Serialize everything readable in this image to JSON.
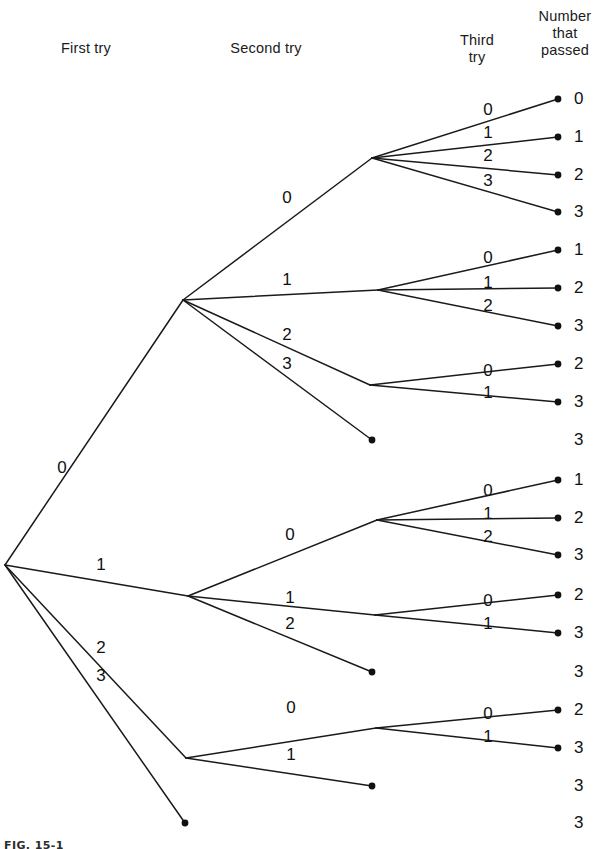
{
  "figure": {
    "caption": "FIG. 15-1",
    "headers": [
      {
        "id": "first-try",
        "label": "First try",
        "x": 86,
        "y": 40
      },
      {
        "id": "second-try",
        "label": "Second try",
        "x": 266,
        "y": 40
      },
      {
        "id": "third-try",
        "label": "Third\ntry",
        "x": 477,
        "y": 32
      },
      {
        "id": "number-passed",
        "label": "Number\nthat\npassed",
        "x": 565,
        "y": 8
      }
    ],
    "line_color": "#1a1a1a",
    "dot_color": "#111111"
  },
  "chart_data": {
    "type": "tree",
    "stages": [
      "First try",
      "Second try",
      "Third try",
      "Number that passed"
    ],
    "root": {
      "x": 5,
      "y": 565
    },
    "nodes": [
      {
        "id": "root",
        "x": 5,
        "y": 565
      },
      {
        "id": "n-0",
        "x": 183,
        "y": 300
      },
      {
        "id": "n-00",
        "x": 372,
        "y": 158
      },
      {
        "id": "n-01",
        "x": 378,
        "y": 290
      },
      {
        "id": "n-02",
        "x": 370,
        "y": 385
      },
      {
        "id": "n-1",
        "x": 188,
        "y": 596
      },
      {
        "id": "n-10",
        "x": 377,
        "y": 520
      },
      {
        "id": "n-11",
        "x": 375,
        "y": 615
      },
      {
        "id": "n-2",
        "x": 186,
        "y": 758
      },
      {
        "id": "n-20",
        "x": 376,
        "y": 728
      }
    ],
    "edges": [
      {
        "from": "root",
        "to": "n-0",
        "label": "0",
        "lx": 62,
        "ly": 468
      },
      {
        "from": "root",
        "to": "n-1",
        "label": "1",
        "lx": 101,
        "ly": 565
      },
      {
        "from": "root",
        "to": "n-2",
        "label": "2",
        "lx": 101,
        "ly": 648
      },
      {
        "from": "root",
        "to": "t-3a",
        "label": "3",
        "lx": 101,
        "ly": 676
      },
      {
        "from": "n-0",
        "to": "n-00",
        "label": "0",
        "lx": 287,
        "y0": 0,
        "ly": 198
      },
      {
        "from": "n-0",
        "to": "n-01",
        "label": "1",
        "lx": 287,
        "ly": 280
      },
      {
        "from": "n-0",
        "to": "n-02",
        "label": "2",
        "lx": 287,
        "ly": 335
      },
      {
        "from": "n-0",
        "to": "t-3b",
        "label": "3",
        "lx": 287,
        "ly": 364
      },
      {
        "from": "n-1",
        "to": "n-10",
        "label": "0",
        "lx": 290,
        "ly": 535
      },
      {
        "from": "n-1",
        "to": "n-11",
        "label": "1",
        "lx": 290,
        "ly": 598
      },
      {
        "from": "n-1",
        "to": "t-3c",
        "label": "2",
        "lx": 290,
        "ly": 624
      },
      {
        "from": "n-2",
        "to": "n-20",
        "label": "0",
        "lx": 291,
        "ly": 708
      },
      {
        "from": "n-2",
        "to": "t-3d",
        "label": "1",
        "lx": 291,
        "ly": 755
      },
      {
        "from": "n-00",
        "to": "e-0",
        "label": "0",
        "lx": 488,
        "ly": 110
      },
      {
        "from": "n-00",
        "to": "e-1",
        "label": "1",
        "lx": 488,
        "ly": 133
      },
      {
        "from": "n-00",
        "to": "e-2",
        "label": "2",
        "lx": 488,
        "ly": 156
      },
      {
        "from": "n-00",
        "to": "e-3",
        "label": "3",
        "lx": 488,
        "ly": 181
      },
      {
        "from": "n-01",
        "to": "e-4",
        "label": "0",
        "lx": 488,
        "ly": 258
      },
      {
        "from": "n-01",
        "to": "e-5",
        "label": "1",
        "lx": 488,
        "ly": 283
      },
      {
        "from": "n-01",
        "to": "e-6",
        "label": "2",
        "lx": 488,
        "ly": 306
      },
      {
        "from": "n-02",
        "to": "e-7",
        "label": "0",
        "lx": 488,
        "ly": 371
      },
      {
        "from": "n-02",
        "to": "e-8",
        "label": "1",
        "lx": 488,
        "ly": 393
      },
      {
        "from": "n-10",
        "to": "e-9",
        "label": "0",
        "lx": 488,
        "ly": 491
      },
      {
        "from": "n-10",
        "to": "e-10",
        "label": "1",
        "lx": 488,
        "ly": 514
      },
      {
        "from": "n-10",
        "to": "e-11",
        "label": "2",
        "lx": 488,
        "ly": 537
      },
      {
        "from": "n-11",
        "to": "e-12",
        "label": "0",
        "lx": 488,
        "ly": 601
      },
      {
        "from": "n-11",
        "to": "e-13",
        "label": "1",
        "lx": 488,
        "ly": 624
      },
      {
        "from": "n-20",
        "to": "e-15",
        "label": "0",
        "lx": 488,
        "ly": 714
      },
      {
        "from": "n-20",
        "to": "e-16",
        "label": "1",
        "lx": 488,
        "ly": 737
      }
    ],
    "endpoints": [
      {
        "id": "e-0",
        "x": 558,
        "y": 99,
        "value": "0",
        "dot": true
      },
      {
        "id": "e-1",
        "x": 558,
        "y": 137,
        "value": "1",
        "dot": true
      },
      {
        "id": "e-2",
        "x": 558,
        "y": 175,
        "value": "2",
        "dot": true
      },
      {
        "id": "e-3",
        "x": 558,
        "y": 212,
        "value": "3",
        "dot": true
      },
      {
        "id": "e-4",
        "x": 558,
        "y": 250,
        "value": "1",
        "dot": true
      },
      {
        "id": "e-5",
        "x": 558,
        "y": 288,
        "value": "2",
        "dot": true
      },
      {
        "id": "e-6",
        "x": 558,
        "y": 326,
        "value": "3",
        "dot": true
      },
      {
        "id": "e-7",
        "x": 558,
        "y": 364,
        "value": "2",
        "dot": true
      },
      {
        "id": "e-8",
        "x": 558,
        "y": 402,
        "value": "3",
        "dot": true
      },
      {
        "id": "t-3b",
        "x": 372,
        "y": 440,
        "value": "3",
        "dot": true,
        "label_x": 558,
        "label_y": 440
      },
      {
        "id": "e-9",
        "x": 558,
        "y": 480,
        "value": "1",
        "dot": true
      },
      {
        "id": "e-10",
        "x": 558,
        "y": 518,
        "value": "2",
        "dot": true
      },
      {
        "id": "e-11",
        "x": 558,
        "y": 555,
        "value": "3",
        "dot": true
      },
      {
        "id": "e-12",
        "x": 558,
        "y": 595,
        "value": "2",
        "dot": true
      },
      {
        "id": "e-13",
        "x": 558,
        "y": 633,
        "value": "3",
        "dot": true
      },
      {
        "id": "t-3c",
        "x": 372,
        "y": 672,
        "value": "3",
        "dot": true,
        "label_x": 558,
        "label_y": 672
      },
      {
        "id": "e-15",
        "x": 558,
        "y": 710,
        "value": "2",
        "dot": true
      },
      {
        "id": "e-16",
        "x": 558,
        "y": 748,
        "value": "3",
        "dot": true
      },
      {
        "id": "t-3d",
        "x": 372,
        "y": 786,
        "value": "3",
        "dot": true,
        "label_x": 558,
        "label_y": 786
      },
      {
        "id": "t-3a",
        "x": 185,
        "y": 823,
        "value": "3",
        "dot": true,
        "label_x": 558,
        "label_y": 823
      }
    ],
    "outcome_column_values": [
      "0",
      "1",
      "2",
      "3",
      "1",
      "2",
      "3",
      "2",
      "3",
      "3",
      "1",
      "2",
      "3",
      "2",
      "3",
      "3",
      "2",
      "3",
      "3",
      "3"
    ]
  }
}
